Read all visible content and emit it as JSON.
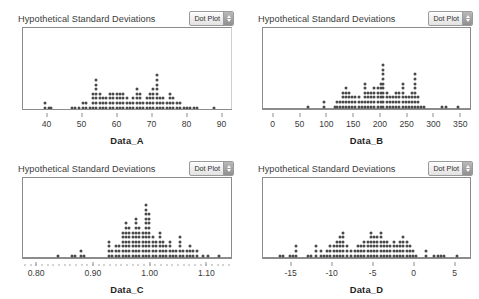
{
  "app": {
    "panel_title": "Hypothetical Standard Deviations",
    "menu_label": "Dot Plot",
    "menu_icon": "stepper-updown-icon"
  },
  "chart_data": [
    {
      "type": "scatter",
      "plot_style": "dot plot",
      "title": "Hypothetical Standard Deviations",
      "xlabel": "Data_A",
      "ylabel": "",
      "grid": false,
      "legend": "none",
      "xlim": [
        33,
        93
      ],
      "xticks": [
        40,
        50,
        60,
        70,
        80,
        90
      ],
      "xticklabels": [
        "40",
        "50",
        "60",
        "70",
        "80",
        "90"
      ],
      "dot_stacks": [
        {
          "x": 39.3,
          "count": 2
        },
        {
          "x": 40.4,
          "count": 1
        },
        {
          "x": 41.2,
          "count": 1
        },
        {
          "x": 47.0,
          "count": 1
        },
        {
          "x": 48.0,
          "count": 1
        },
        {
          "x": 49.2,
          "count": 1
        },
        {
          "x": 50.4,
          "count": 2
        },
        {
          "x": 51.3,
          "count": 2
        },
        {
          "x": 52.2,
          "count": 1
        },
        {
          "x": 53.2,
          "count": 4
        },
        {
          "x": 54.1,
          "count": 7
        },
        {
          "x": 55.1,
          "count": 4
        },
        {
          "x": 56.1,
          "count": 3
        },
        {
          "x": 57.0,
          "count": 3
        },
        {
          "x": 58.0,
          "count": 4
        },
        {
          "x": 59.0,
          "count": 4
        },
        {
          "x": 60.0,
          "count": 4
        },
        {
          "x": 60.9,
          "count": 4
        },
        {
          "x": 61.9,
          "count": 4
        },
        {
          "x": 62.9,
          "count": 3
        },
        {
          "x": 63.8,
          "count": 2
        },
        {
          "x": 64.8,
          "count": 3
        },
        {
          "x": 65.8,
          "count": 5
        },
        {
          "x": 66.7,
          "count": 4
        },
        {
          "x": 67.7,
          "count": 2
        },
        {
          "x": 68.7,
          "count": 3
        },
        {
          "x": 69.6,
          "count": 4
        },
        {
          "x": 70.6,
          "count": 5
        },
        {
          "x": 71.6,
          "count": 8
        },
        {
          "x": 72.5,
          "count": 3
        },
        {
          "x": 73.5,
          "count": 3
        },
        {
          "x": 74.5,
          "count": 2
        },
        {
          "x": 75.4,
          "count": 4
        },
        {
          "x": 76.4,
          "count": 3
        },
        {
          "x": 77.4,
          "count": 2
        },
        {
          "x": 78.3,
          "count": 2
        },
        {
          "x": 79.3,
          "count": 1
        },
        {
          "x": 80.3,
          "count": 1
        },
        {
          "x": 81.2,
          "count": 1
        },
        {
          "x": 82.2,
          "count": 1
        },
        {
          "x": 83.2,
          "count": 1
        },
        {
          "x": 88.0,
          "count": 1
        }
      ]
    },
    {
      "type": "scatter",
      "plot_style": "dot plot",
      "title": "Hypothetical Standard Deviations",
      "xlabel": "Data_B",
      "ylabel": "",
      "grid": false,
      "legend": "none",
      "xlim": [
        -20,
        370
      ],
      "xticks": [
        0,
        50,
        100,
        150,
        200,
        250,
        300,
        350
      ],
      "xticklabels": [
        "0",
        "50",
        "100",
        "150",
        "200",
        "250",
        "300",
        "350"
      ],
      "dot_stacks": [
        {
          "x": 65,
          "count": 1
        },
        {
          "x": 95,
          "count": 2
        },
        {
          "x": 115,
          "count": 1
        },
        {
          "x": 120,
          "count": 2
        },
        {
          "x": 125,
          "count": 2
        },
        {
          "x": 130,
          "count": 4
        },
        {
          "x": 136,
          "count": 5
        },
        {
          "x": 142,
          "count": 4
        },
        {
          "x": 148,
          "count": 3
        },
        {
          "x": 154,
          "count": 3
        },
        {
          "x": 160,
          "count": 3
        },
        {
          "x": 166,
          "count": 2
        },
        {
          "x": 172,
          "count": 6
        },
        {
          "x": 178,
          "count": 4
        },
        {
          "x": 184,
          "count": 4
        },
        {
          "x": 190,
          "count": 5
        },
        {
          "x": 196,
          "count": 5
        },
        {
          "x": 202,
          "count": 6
        },
        {
          "x": 207,
          "count": 10
        },
        {
          "x": 213,
          "count": 4
        },
        {
          "x": 219,
          "count": 3
        },
        {
          "x": 225,
          "count": 3
        },
        {
          "x": 231,
          "count": 4
        },
        {
          "x": 237,
          "count": 4
        },
        {
          "x": 243,
          "count": 6
        },
        {
          "x": 249,
          "count": 3
        },
        {
          "x": 255,
          "count": 3
        },
        {
          "x": 261,
          "count": 4
        },
        {
          "x": 266,
          "count": 8
        },
        {
          "x": 272,
          "count": 3
        },
        {
          "x": 278,
          "count": 1
        },
        {
          "x": 284,
          "count": 1
        },
        {
          "x": 318,
          "count": 1
        },
        {
          "x": 324,
          "count": 1
        },
        {
          "x": 348,
          "count": 1
        }
      ]
    },
    {
      "type": "scatter",
      "plot_style": "dot plot",
      "title": "Hypothetical Standard Deviations",
      "xlabel": "Data_C",
      "ylabel": "",
      "grid": false,
      "legend": "none",
      "xlim": [
        0.775,
        1.145
      ],
      "xticks": [
        0.8,
        0.9,
        1.0,
        1.1
      ],
      "xticklabels": [
        "0.80",
        "0.90",
        "1.00",
        "1.10"
      ],
      "dot_stacks": [
        {
          "x": 0.838,
          "count": 1
        },
        {
          "x": 0.862,
          "count": 1
        },
        {
          "x": 0.868,
          "count": 1
        },
        {
          "x": 0.878,
          "count": 2
        },
        {
          "x": 0.884,
          "count": 1
        },
        {
          "x": 0.928,
          "count": 4
        },
        {
          "x": 0.934,
          "count": 2
        },
        {
          "x": 0.94,
          "count": 3
        },
        {
          "x": 0.946,
          "count": 3
        },
        {
          "x": 0.952,
          "count": 6
        },
        {
          "x": 0.958,
          "count": 8
        },
        {
          "x": 0.964,
          "count": 7
        },
        {
          "x": 0.97,
          "count": 6
        },
        {
          "x": 0.976,
          "count": 9
        },
        {
          "x": 0.982,
          "count": 7
        },
        {
          "x": 0.988,
          "count": 6
        },
        {
          "x": 0.994,
          "count": 12
        },
        {
          "x": 1.0,
          "count": 10
        },
        {
          "x": 1.006,
          "count": 5
        },
        {
          "x": 1.012,
          "count": 4
        },
        {
          "x": 1.018,
          "count": 6
        },
        {
          "x": 1.024,
          "count": 4
        },
        {
          "x": 1.03,
          "count": 3
        },
        {
          "x": 1.036,
          "count": 4
        },
        {
          "x": 1.042,
          "count": 2
        },
        {
          "x": 1.048,
          "count": 2
        },
        {
          "x": 1.054,
          "count": 5
        },
        {
          "x": 1.06,
          "count": 2
        },
        {
          "x": 1.066,
          "count": 2
        },
        {
          "x": 1.072,
          "count": 3
        },
        {
          "x": 1.078,
          "count": 2
        },
        {
          "x": 1.084,
          "count": 2
        },
        {
          "x": 1.096,
          "count": 1
        },
        {
          "x": 1.104,
          "count": 1
        },
        {
          "x": 1.124,
          "count": 1
        }
      ]
    },
    {
      "type": "scatter",
      "plot_style": "dot plot",
      "title": "Hypothetical Standard Deviations",
      "xlabel": "Data_D",
      "ylabel": "",
      "grid": false,
      "legend": "none",
      "xlim": [
        -18.5,
        7.0
      ],
      "xticks": [
        -15,
        -10,
        -5,
        0,
        5
      ],
      "xticklabels": [
        "-15",
        "-10",
        "-5",
        "0",
        "5"
      ],
      "dot_stacks": [
        {
          "x": -16.4,
          "count": 1
        },
        {
          "x": -16.0,
          "count": 1
        },
        {
          "x": -15.2,
          "count": 1
        },
        {
          "x": -14.8,
          "count": 1
        },
        {
          "x": -14.4,
          "count": 3
        },
        {
          "x": -13.0,
          "count": 1
        },
        {
          "x": -12.6,
          "count": 1
        },
        {
          "x": -12.0,
          "count": 3
        },
        {
          "x": -11.4,
          "count": 2
        },
        {
          "x": -11.0,
          "count": 1
        },
        {
          "x": -10.6,
          "count": 2
        },
        {
          "x": -10.2,
          "count": 3
        },
        {
          "x": -9.8,
          "count": 3
        },
        {
          "x": -9.4,
          "count": 4
        },
        {
          "x": -9.0,
          "count": 5
        },
        {
          "x": -8.6,
          "count": 6
        },
        {
          "x": -8.2,
          "count": 3
        },
        {
          "x": -7.6,
          "count": 2
        },
        {
          "x": -7.2,
          "count": 2
        },
        {
          "x": -6.8,
          "count": 3
        },
        {
          "x": -6.4,
          "count": 3
        },
        {
          "x": -6.0,
          "count": 4
        },
        {
          "x": -5.6,
          "count": 4
        },
        {
          "x": -5.2,
          "count": 6
        },
        {
          "x": -4.8,
          "count": 5
        },
        {
          "x": -4.4,
          "count": 5
        },
        {
          "x": -4.0,
          "count": 6
        },
        {
          "x": -3.6,
          "count": 4
        },
        {
          "x": -3.2,
          "count": 4
        },
        {
          "x": -2.8,
          "count": 3
        },
        {
          "x": -2.4,
          "count": 4
        },
        {
          "x": -2.0,
          "count": 3
        },
        {
          "x": -1.6,
          "count": 4
        },
        {
          "x": -1.2,
          "count": 5
        },
        {
          "x": -0.8,
          "count": 4
        },
        {
          "x": -0.4,
          "count": 3
        },
        {
          "x": 0.0,
          "count": 2
        },
        {
          "x": 0.4,
          "count": 1
        },
        {
          "x": 1.6,
          "count": 2
        },
        {
          "x": 2.6,
          "count": 1
        },
        {
          "x": 3.0,
          "count": 1
        },
        {
          "x": 3.4,
          "count": 1
        },
        {
          "x": 3.8,
          "count": 1
        },
        {
          "x": 5.4,
          "count": 1
        }
      ]
    }
  ],
  "panels": [
    {
      "frame_style": "open",
      "minor_ticks": false
    },
    {
      "frame_style": "full",
      "minor_ticks": false
    },
    {
      "frame_style": "full",
      "minor_ticks": true
    },
    {
      "frame_style": "full",
      "minor_ticks": false
    }
  ]
}
